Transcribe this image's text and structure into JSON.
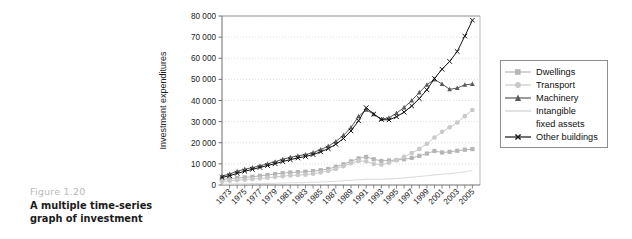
{
  "figure": {
    "number": "Figure 1.20",
    "title": "A multiple time-series graph of investment"
  },
  "chart_data": {
    "type": "line",
    "title": "",
    "xlabel": "",
    "ylabel": "Investment expenditures",
    "ylim": [
      0,
      80000
    ],
    "xlim": [
      1972,
      2006
    ],
    "grid": true,
    "grid_style": "dotted-horizontal",
    "legend_position": "right-outside",
    "ytick_labels": [
      "0",
      "10 000",
      "20 000",
      "30 000",
      "40 000",
      "50 000",
      "60 000",
      "70 000",
      "80 000"
    ],
    "ytick_values": [
      0,
      10000,
      20000,
      30000,
      40000,
      50000,
      60000,
      70000,
      80000
    ],
    "xtick_labels": [
      "1973",
      "1975",
      "1977",
      "1979",
      "1981",
      "1983",
      "1985",
      "1987",
      "1989",
      "1991",
      "1993",
      "1995",
      "1997",
      "1999",
      "2001",
      "2003",
      "2005"
    ],
    "x": [
      1972,
      1973,
      1974,
      1975,
      1976,
      1977,
      1978,
      1979,
      1980,
      1981,
      1982,
      1983,
      1984,
      1985,
      1986,
      1987,
      1988,
      1989,
      1990,
      1991,
      1992,
      1993,
      1994,
      1995,
      1996,
      1997,
      1998,
      1999,
      2000,
      2001,
      2002,
      2003,
      2004,
      2005
    ],
    "series": [
      {
        "name": "Dwellings",
        "color": "#b5b5b5",
        "marker": "square",
        "values": [
          2600,
          3000,
          3300,
          3600,
          3900,
          4300,
          4700,
          5200,
          5600,
          5900,
          6100,
          6300,
          6600,
          7000,
          7600,
          8600,
          9800,
          11200,
          12600,
          13300,
          12200,
          11400,
          11600,
          11800,
          12200,
          12800,
          13800,
          14900,
          16100,
          15400,
          15700,
          16200,
          16700,
          17000
        ]
      },
      {
        "name": "Transport",
        "color": "#c9c9c9",
        "marker": "circle",
        "values": [
          1700,
          2000,
          2300,
          2500,
          2800,
          3100,
          3400,
          3800,
          4200,
          4500,
          4700,
          4900,
          5300,
          5900,
          6600,
          7600,
          8900,
          10300,
          11400,
          11200,
          10000,
          9600,
          10500,
          11800,
          13300,
          15100,
          17100,
          19500,
          22500,
          25200,
          27300,
          29600,
          32600,
          35500
        ]
      },
      {
        "name": "Machinery",
        "color": "#5a5a5a",
        "marker": "triangle",
        "values": [
          4200,
          5200,
          6500,
          7500,
          8200,
          9100,
          10000,
          11000,
          12200,
          13100,
          13800,
          14400,
          15300,
          16800,
          18400,
          20600,
          23500,
          27200,
          32500,
          35600,
          33500,
          31200,
          31800,
          34000,
          36700,
          40000,
          43800,
          47400,
          50000,
          47800,
          45300,
          45900,
          47400,
          47800
        ]
      },
      {
        "name": "Intangible fixed assets",
        "color": "#dcdcdc",
        "marker": "none",
        "values": [
          400,
          450,
          520,
          580,
          640,
          700,
          780,
          860,
          950,
          1030,
          1100,
          1180,
          1280,
          1400,
          1550,
          1750,
          1980,
          2250,
          2500,
          2650,
          2700,
          2750,
          2900,
          3100,
          3350,
          3650,
          4000,
          4400,
          4800,
          5100,
          5400,
          5800,
          6300,
          6900
        ]
      },
      {
        "name": "Other buildings",
        "color": "#151515",
        "marker": "x",
        "values": [
          3600,
          4400,
          5500,
          6500,
          7400,
          8300,
          9200,
          10100,
          11100,
          12000,
          12800,
          13500,
          14400,
          15700,
          17200,
          19300,
          22000,
          25600,
          30400,
          36600,
          33600,
          31000,
          30800,
          32300,
          34500,
          37400,
          40900,
          45100,
          50400,
          54800,
          58500,
          63200,
          70500,
          78000
        ]
      }
    ]
  },
  "legend": {
    "entries": [
      {
        "label": "Dwellings"
      },
      {
        "label": "Transport"
      },
      {
        "label": "Machinery"
      },
      {
        "label": "Intangible"
      },
      {
        "label": "fixed assets"
      },
      {
        "label": "Other buildings"
      }
    ]
  }
}
